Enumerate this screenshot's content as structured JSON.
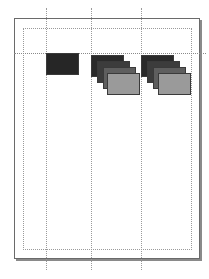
{
  "canvas": {
    "page": {
      "x": 14,
      "y": 18,
      "width": 186,
      "height": 241
    },
    "margin": {
      "x": 23,
      "y": 28,
      "width": 169,
      "height": 222
    },
    "vertical_guides": [
      46,
      91,
      141
    ],
    "horizontal_guides": [
      53
    ]
  },
  "shapes": {
    "group1": [
      {
        "x": 46,
        "y": 53,
        "w": 33,
        "h": 22,
        "color": "#262626"
      }
    ],
    "group2": [
      {
        "x": 91,
        "y": 55,
        "w": 33,
        "h": 22,
        "color": "#2a2a2a"
      },
      {
        "x": 97,
        "y": 61,
        "w": 33,
        "h": 22,
        "color": "#3c3c3c"
      },
      {
        "x": 103,
        "y": 67,
        "w": 33,
        "h": 22,
        "color": "#5e5e5e"
      },
      {
        "x": 107,
        "y": 73,
        "w": 33,
        "h": 22,
        "color": "#9a9a9a"
      }
    ],
    "group3": [
      {
        "x": 141,
        "y": 55,
        "w": 33,
        "h": 22,
        "color": "#2a2a2a"
      },
      {
        "x": 147,
        "y": 61,
        "w": 33,
        "h": 22,
        "color": "#3c3c3c"
      },
      {
        "x": 153,
        "y": 67,
        "w": 33,
        "h": 22,
        "color": "#5e5e5e"
      },
      {
        "x": 158,
        "y": 73,
        "w": 33,
        "h": 22,
        "color": "#9a9a9a"
      }
    ]
  }
}
